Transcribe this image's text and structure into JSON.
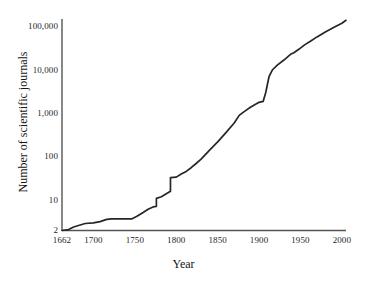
{
  "chart_data": {
    "type": "line",
    "title": "",
    "xlabel": "Year",
    "ylabel": "Number of scientific journals",
    "xlim": [
      1662,
      2005
    ],
    "ylim": [
      2,
      150000
    ],
    "yscale": "log",
    "xscale": "linear",
    "grid": false,
    "legend": null,
    "line_color": "#262626",
    "xticks": [
      1662,
      1700,
      1750,
      1800,
      1850,
      1900,
      1950,
      2000
    ],
    "xtick_labels": [
      "1662",
      "1700",
      "1750",
      "1800",
      "1850",
      "1900",
      "1950",
      "2000"
    ],
    "yticks": [
      2,
      10,
      100,
      1000,
      10000,
      100000
    ],
    "ytick_labels": [
      "2",
      "10",
      "100",
      "1,000",
      "10,000",
      "100,000"
    ],
    "series": [
      {
        "name": "Number of scientific journals",
        "x": [
          1662,
          1670,
          1676,
          1682,
          1690,
          1700,
          1708,
          1716,
          1722,
          1730,
          1740,
          1746,
          1752,
          1760,
          1766,
          1772,
          1776,
          1776,
          1782,
          1788,
          1793,
          1793,
          1800,
          1806,
          1812,
          1818,
          1824,
          1830,
          1840,
          1850,
          1860,
          1870,
          1876,
          1882,
          1890,
          1900,
          1905,
          1908,
          1912,
          1916,
          1922,
          1930,
          1938,
          1942,
          1948,
          1955,
          1962,
          1970,
          1980,
          1990,
          2000,
          2005
        ],
        "y": [
          2,
          2.1,
          2.4,
          2.6,
          2.9,
          3.0,
          3.2,
          3.6,
          3.7,
          3.7,
          3.7,
          3.7,
          4.2,
          5.2,
          6.2,
          7.0,
          7.2,
          11,
          12,
          14,
          16,
          33,
          34,
          40,
          46,
          56,
          70,
          88,
          140,
          220,
          360,
          600,
          900,
          1100,
          1400,
          1800,
          1900,
          3000,
          7000,
          10000,
          13000,
          17000,
          23000,
          25000,
          30000,
          38000,
          46000,
          58000,
          75000,
          95000,
          120000,
          140000
        ]
      }
    ],
    "annotations": []
  }
}
